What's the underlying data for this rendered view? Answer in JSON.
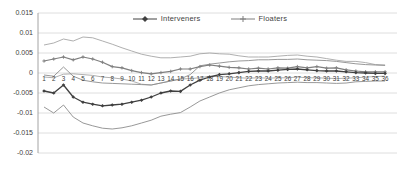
{
  "chart_data": {
    "type": "line",
    "title": "",
    "xlabel": "",
    "ylabel": "",
    "ylim": [
      -0.02,
      0.015
    ],
    "grid": true,
    "legend_position": "top-center",
    "ytick_labels": [
      "0.015",
      "0.01",
      "0.005",
      "0",
      "-0.005",
      "-0.01",
      "-0.015",
      "-0.02"
    ],
    "ytick_values": [
      0.015,
      0.01,
      0.005,
      0,
      -0.005,
      -0.01,
      -0.015,
      -0.02
    ],
    "x": [
      1,
      2,
      3,
      4,
      5,
      6,
      7,
      8,
      9,
      10,
      11,
      12,
      13,
      14,
      15,
      16,
      17,
      18,
      19,
      20,
      21,
      22,
      23,
      24,
      25,
      26,
      27,
      28,
      29,
      30,
      31,
      32,
      33,
      34,
      35,
      36
    ],
    "legend": [
      {
        "label": "Interveners",
        "color": "#404040",
        "marker": "diamond"
      },
      {
        "label": "Floaters",
        "color": "#7f7f7f",
        "marker": "plus"
      }
    ],
    "series": [
      {
        "name": "Floaters upper band",
        "role": "band",
        "color": "#a6a6a6",
        "width": 0.9,
        "marker": "none",
        "values": [
          0.007,
          0.0075,
          0.0085,
          0.008,
          0.009,
          0.0088,
          0.008,
          0.0072,
          0.0063,
          0.0055,
          0.0047,
          0.0042,
          0.0038,
          0.0038,
          0.004,
          0.0042,
          0.0048,
          0.005,
          0.0048,
          0.0047,
          0.0043,
          0.004,
          0.004,
          0.004,
          0.0042,
          0.0044,
          0.0045,
          0.0042,
          0.004,
          0.0036,
          0.0032,
          0.0029,
          0.0029,
          0.0026,
          0.0021,
          0.002
        ]
      },
      {
        "name": "Floaters lower band",
        "role": "band",
        "color": "#a6a6a6",
        "width": 0.9,
        "marker": "none",
        "values": [
          -0.001,
          -0.0012,
          -0.0003,
          -0.0002,
          -0.0004,
          -0.0006,
          -0.001,
          -0.0012,
          -0.0015,
          -0.002,
          -0.0028,
          -0.003,
          -0.0025,
          -0.002,
          -0.0015,
          -0.0014,
          -0.0012,
          -0.0008,
          -0.0009,
          -0.001,
          -0.0012,
          -0.0013,
          -0.0012,
          -0.0013,
          -0.0012,
          -0.0012,
          -0.001,
          -0.0012,
          -0.0012,
          -0.0013,
          -0.0014,
          -0.0013,
          -0.0012,
          -0.001,
          -0.0009,
          -0.0008
        ]
      },
      {
        "name": "Interveners upper band",
        "role": "band",
        "color": "#8c8c8c",
        "width": 0.9,
        "marker": "none",
        "values": [
          -0.0005,
          -0.0008,
          0.0015,
          -0.0008,
          -0.0018,
          -0.0022,
          -0.0025,
          -0.0026,
          -0.0027,
          -0.0028,
          -0.0029,
          -0.003,
          -0.0025,
          -0.002,
          -0.0015,
          -0.0004,
          0.0018,
          0.0022,
          0.0025,
          0.0028,
          0.003,
          0.0031,
          0.0033,
          0.0033,
          0.0034,
          0.0034,
          0.0035,
          0.0033,
          0.0032,
          0.0031,
          0.0029,
          0.0026,
          0.0023,
          0.0021,
          0.002,
          0.0019
        ]
      },
      {
        "name": "Interveners lower band",
        "role": "band",
        "color": "#8c8c8c",
        "width": 0.9,
        "marker": "none",
        "values": [
          -0.0085,
          -0.01,
          -0.008,
          -0.011,
          -0.0125,
          -0.0132,
          -0.0138,
          -0.014,
          -0.0137,
          -0.0132,
          -0.0125,
          -0.0118,
          -0.0108,
          -0.0103,
          -0.0099,
          -0.0085,
          -0.007,
          -0.006,
          -0.005,
          -0.0042,
          -0.0037,
          -0.0032,
          -0.0029,
          -0.0027,
          -0.0025,
          -0.0024,
          -0.0023,
          -0.0024,
          -0.0024,
          -0.0025,
          -0.0026,
          -0.0025,
          -0.0022,
          -0.0021,
          -0.002,
          -0.002
        ]
      },
      {
        "name": "Floaters",
        "role": "center",
        "color": "#7f7f7f",
        "width": 1.2,
        "marker": "plus",
        "values": [
          0.003,
          0.0035,
          0.004,
          0.0033,
          0.004,
          0.0035,
          0.0027,
          0.0016,
          0.0013,
          0.0006,
          0.0001,
          -0.0002,
          0.0001,
          0.0004,
          0.001,
          0.001,
          0.0016,
          0.002,
          0.0017,
          0.0014,
          0.0013,
          0.001,
          0.0012,
          0.001,
          0.0013,
          0.0012,
          0.0016,
          0.0013,
          0.0016,
          0.0012,
          0.0013,
          0.0008,
          0.0005,
          0.0003,
          0.0003,
          0.0003
        ]
      },
      {
        "name": "Interveners",
        "role": "center",
        "color": "#404040",
        "width": 1.3,
        "marker": "diamond",
        "values": [
          -0.0045,
          -0.005,
          -0.003,
          -0.006,
          -0.0073,
          -0.0078,
          -0.0082,
          -0.008,
          -0.0078,
          -0.0073,
          -0.0068,
          -0.006,
          -0.005,
          -0.0045,
          -0.0046,
          -0.003,
          -0.0018,
          -0.001,
          -0.0004,
          -0.0002,
          0.0001,
          0.0004,
          0.0005,
          0.0005,
          0.0007,
          0.0009,
          0.001,
          0.0008,
          0.0006,
          0.0005,
          0.0005,
          0.0003,
          0.0001,
          0.0,
          -0.0001,
          -0.0001
        ]
      }
    ],
    "axis_color": "#9a9a9a",
    "grid_color": "#d6d6d6"
  }
}
